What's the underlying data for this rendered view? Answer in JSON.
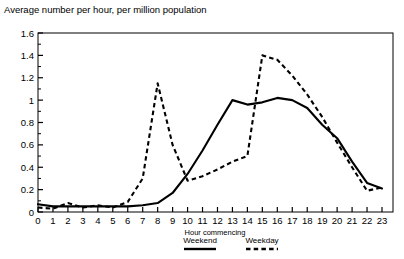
{
  "chart_data": {
    "type": "line",
    "title": "Average number per hour, per million population",
    "xlabel": "Hour commencing",
    "ylabel": "",
    "xlim": [
      0,
      23
    ],
    "ylim": [
      0,
      1.6
    ],
    "grid": false,
    "legend_position": "bottom",
    "x": [
      0,
      1,
      2,
      3,
      4,
      5,
      6,
      7,
      8,
      9,
      10,
      11,
      12,
      13,
      14,
      15,
      16,
      17,
      18,
      19,
      20,
      21,
      22,
      23
    ],
    "ytick_labels": [
      "0",
      "0.2",
      "0.4",
      "0.6",
      "0.8",
      "1",
      "1.2",
      "1.4",
      "1.6"
    ],
    "ytick_values": [
      0,
      0.2,
      0.4,
      0.6,
      0.8,
      1.0,
      1.2,
      1.4,
      1.6
    ],
    "minor_ytick_step": 0.1,
    "xtick_labels": [
      "0",
      "1",
      "2",
      "3",
      "4",
      "5",
      "6",
      "7",
      "8",
      "9",
      "10",
      "11",
      "12",
      "13",
      "14",
      "15",
      "16",
      "17",
      "18",
      "19",
      "20",
      "21",
      "22",
      "23"
    ],
    "series": [
      {
        "name": "Weekend",
        "style": "solid",
        "color": "#000000",
        "values": [
          0.07,
          0.05,
          0.05,
          0.05,
          0.05,
          0.05,
          0.05,
          0.06,
          0.08,
          0.17,
          0.34,
          0.55,
          0.78,
          1.0,
          0.96,
          0.98,
          1.02,
          1.0,
          0.93,
          0.78,
          0.66,
          0.45,
          0.26,
          0.21
        ]
      },
      {
        "name": "Weekday",
        "style": "dashed",
        "color": "#000000",
        "values": [
          0.04,
          0.03,
          0.08,
          0.04,
          0.06,
          0.04,
          0.09,
          0.3,
          1.15,
          0.6,
          0.28,
          0.32,
          0.38,
          0.45,
          0.5,
          1.4,
          1.36,
          1.22,
          1.05,
          0.85,
          0.62,
          0.4,
          0.19,
          0.22
        ]
      }
    ]
  },
  "legend": {
    "entries": [
      {
        "label": "Weekend",
        "style": "solid"
      },
      {
        "label": "Weekday",
        "style": "dashed"
      }
    ]
  }
}
